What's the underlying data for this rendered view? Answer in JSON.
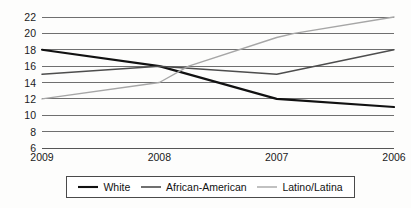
{
  "chart_data": {
    "type": "line",
    "title": "",
    "subtitle": "",
    "xlabel": "",
    "ylabel": "",
    "categories": [
      "2009",
      "2008",
      "2007",
      "2006"
    ],
    "ylim": [
      6,
      22
    ],
    "yticks": [
      22,
      20,
      18,
      16,
      14,
      12,
      10,
      8,
      6
    ],
    "grid": true,
    "legend_position": "bottom",
    "series": [
      {
        "name": "White",
        "color": "#111111",
        "width": 2.1,
        "values": [
          18,
          16,
          12,
          11
        ]
      },
      {
        "name": "African-American",
        "color": "#4d4d4d",
        "width": 1.5,
        "values": [
          15,
          16,
          15,
          18
        ]
      },
      {
        "name": "Latino/Latina",
        "color": "#a6a6a6",
        "width": 1.4,
        "values": [
          12,
          14,
          19.5,
          22
        ],
        "extra_points": [
          {
            "x": 2.15,
            "y": 20
          },
          {
            "x": 1.25,
            "y": 16
          }
        ]
      }
    ]
  },
  "axes": {
    "y_tick_labels": [
      "22",
      "20",
      "18",
      "16",
      "14",
      "12",
      "10",
      "8",
      "6"
    ],
    "x_tick_labels": [
      "2009",
      "2008",
      "2007",
      "2006"
    ]
  },
  "legend": {
    "items": [
      {
        "label": "White",
        "color": "#111111",
        "width": 2.1
      },
      {
        "label": "African-American",
        "color": "#4d4d4d",
        "width": 1.6
      },
      {
        "label": "Latino/Latina",
        "color": "#a6a6a6",
        "width": 1.4
      }
    ]
  }
}
